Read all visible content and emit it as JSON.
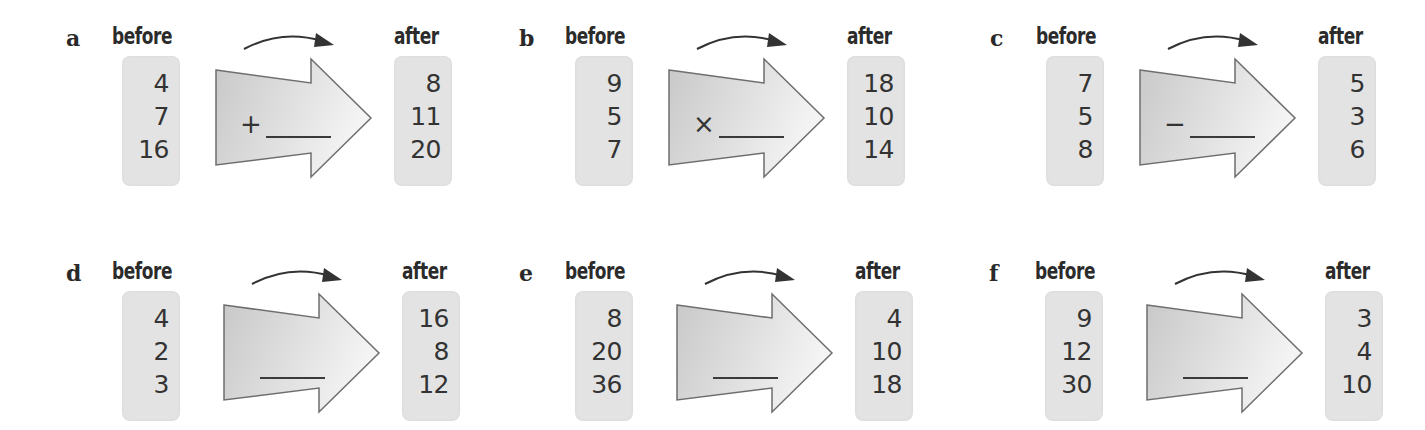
{
  "labels": {
    "before": "before",
    "after": "after"
  },
  "panels": [
    {
      "letter": "a",
      "operator": "+",
      "before": [
        "4",
        "7",
        "16"
      ],
      "after": [
        "8",
        "11",
        "20"
      ]
    },
    {
      "letter": "b",
      "operator": "×",
      "before": [
        "9",
        "5",
        "7"
      ],
      "after": [
        "18",
        "10",
        "14"
      ]
    },
    {
      "letter": "c",
      "operator": "−",
      "before": [
        "7",
        "5",
        "8"
      ],
      "after": [
        "5",
        "3",
        "6"
      ]
    },
    {
      "letter": "d",
      "operator": "",
      "before": [
        "4",
        "2",
        "3"
      ],
      "after": [
        "16",
        "8",
        "12"
      ]
    },
    {
      "letter": "e",
      "operator": "",
      "before": [
        "8",
        "20",
        "36"
      ],
      "after": [
        "4",
        "10",
        "18"
      ]
    },
    {
      "letter": "f",
      "operator": "",
      "before": [
        "9",
        "12",
        "30"
      ],
      "after": [
        "3",
        "4",
        "10"
      ]
    }
  ],
  "colors": {
    "box_fill": "#e3e3e3",
    "text": "#333333",
    "arrow_stroke": "#6e6e6e"
  }
}
